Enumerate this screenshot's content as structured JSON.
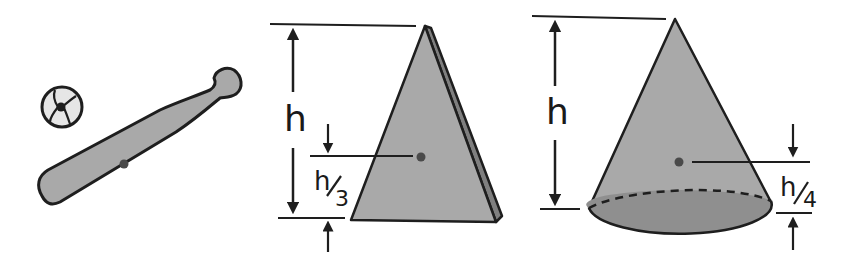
{
  "figure": {
    "colors": {
      "fill": "#a9a9a9",
      "fill_dark": "#7f7f7f",
      "stroke": "#1e1e1e",
      "ball_fill": "#e6e6e6",
      "dot": "#4a4a4a"
    },
    "objects": [
      {
        "name": "baseball"
      },
      {
        "name": "baseball-bat",
        "feature": "center of mass dot"
      },
      {
        "name": "triangular-plate",
        "height_label": "h",
        "offset_label_num": "h",
        "offset_label_den": "3"
      },
      {
        "name": "cone",
        "height_label": "h",
        "offset_label_num": "h",
        "offset_label_den": "4"
      }
    ]
  }
}
